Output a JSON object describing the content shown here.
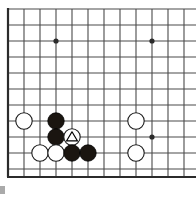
{
  "diagram": {
    "kind": "go-board-diagram",
    "board": {
      "origin_x": 8,
      "origin_y": 9,
      "spacing": 16,
      "cols": 12,
      "rows": 11,
      "border": {
        "left": true,
        "top": false,
        "right": false,
        "bottom": true,
        "bottom_y": 177,
        "edge_color": "#2b2b2b",
        "edge_width": 2.2
      },
      "line_color": "#4a4a4a",
      "line_width": 1.1,
      "background_color": "#ffffff"
    },
    "star_points": [
      {
        "name": "star-point-upper-left",
        "col": 3,
        "row": 2,
        "radius": 2.6
      },
      {
        "name": "star-point-upper-right",
        "col": 9,
        "row": 2,
        "radius": 2.6
      },
      {
        "name": "star-point-lower-right",
        "col": 9,
        "row": 8,
        "radius": 2.6
      }
    ],
    "stone_radius": 8.2,
    "stones": [
      {
        "id": "white-1",
        "color": "white",
        "col": 1,
        "row": 7,
        "mark": "none",
        "label": ""
      },
      {
        "id": "black-1",
        "color": "black",
        "col": 3,
        "row": 7,
        "mark": "none",
        "label": ""
      },
      {
        "id": "white-2",
        "color": "white",
        "col": 8,
        "row": 7,
        "mark": "none",
        "label": ""
      },
      {
        "id": "black-2",
        "color": "black",
        "col": 3,
        "row": 8,
        "mark": "none",
        "label": ""
      },
      {
        "id": "white-triangle",
        "color": "white",
        "col": 4,
        "row": 8,
        "mark": "triangle",
        "label": ""
      },
      {
        "id": "white-3",
        "color": "white",
        "col": 2,
        "row": 9,
        "mark": "none",
        "label": ""
      },
      {
        "id": "white-4",
        "color": "white",
        "col": 3,
        "row": 9,
        "mark": "none",
        "label": ""
      },
      {
        "id": "black-3",
        "color": "black",
        "col": 4,
        "row": 9,
        "mark": "none",
        "label": ""
      },
      {
        "id": "black-4",
        "color": "black",
        "col": 5,
        "row": 9,
        "mark": "none",
        "label": ""
      },
      {
        "id": "white-5",
        "color": "white",
        "col": 8,
        "row": 9,
        "mark": "none",
        "label": ""
      }
    ],
    "colors": {
      "black_stone_fill": "#1a1510",
      "black_stone_stroke": "#000000",
      "white_stone_fill": "#ffffff",
      "white_stone_stroke": "#1a1a1a",
      "mark_color": "#000000",
      "grid_line": "#4a4a4a",
      "border_line": "#2b2b2b"
    },
    "artifact": {
      "name": "corner-scan-artifact",
      "x": 0,
      "y": 186,
      "width": 5,
      "height": 8,
      "color": "#8d8d8d"
    }
  }
}
